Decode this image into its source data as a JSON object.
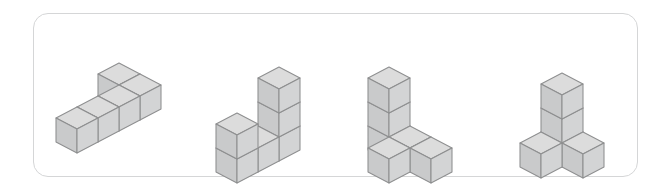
{
  "panel": {
    "name": "cube-figures-panel",
    "border_color": "#d5d6d7",
    "background_color": "#ffffff",
    "corner_radius_px": 15,
    "x": 33,
    "y": 13,
    "width": 605,
    "height": 164
  },
  "render": {
    "image_width": 671,
    "image_height": 191,
    "projection": "isometric",
    "cube_half_width_px": 21,
    "cube_height_px": 24,
    "cube_depth_rise_px": 11,
    "face_colors": {
      "top": "#dcdcdc",
      "left": "#c9cacb",
      "right": "#d3d4d5"
    },
    "outline_color": "#8e8f90",
    "outline_width_px": 1.05
  },
  "figures": [
    {
      "name": "figure-1-l-shape",
      "label": "",
      "cube_count": 5,
      "origin_x": 108,
      "origin_y": 108,
      "description": "flat L-shaped arrangement of five cubes lying on one layer",
      "cubes": [
        {
          "x": 0,
          "y": 0,
          "z": 0
        },
        {
          "x": 1,
          "y": 0,
          "z": 0
        },
        {
          "x": 1,
          "y": 1,
          "z": 0
        },
        {
          "x": 1,
          "y": 2,
          "z": 0
        },
        {
          "x": 1,
          "y": 3,
          "z": 0
        }
      ]
    },
    {
      "name": "figure-2-u-shape",
      "label": "",
      "cube_count": 6,
      "origin_x": 258,
      "origin_y": 125,
      "description": "U-shaped arrangement: row of three cubes with a two-high column on the left end and a one-high column on the right end",
      "cubes": [
        {
          "x": 0,
          "y": 0,
          "z": 0
        },
        {
          "x": 0,
          "y": 1,
          "z": 0
        },
        {
          "x": 0,
          "y": 2,
          "z": 0
        },
        {
          "x": 0,
          "y": 0,
          "z": 1
        },
        {
          "x": 0,
          "y": 0,
          "z": 2
        },
        {
          "x": 0,
          "y": 2,
          "z": 1
        }
      ]
    },
    {
      "name": "figure-3-corner-stack",
      "label": "",
      "cube_count": 6,
      "origin_x": 410,
      "origin_y": 125,
      "description": "three-high column on the right with an arm of cubes extending to the left and one cube in front",
      "cubes": [
        {
          "x": 0,
          "y": 0,
          "z": 0
        },
        {
          "x": 0,
          "y": 0,
          "z": 1
        },
        {
          "x": 0,
          "y": 0,
          "z": 2
        },
        {
          "x": 1,
          "y": 0,
          "z": 0
        },
        {
          "x": 2,
          "y": 0,
          "z": 0
        },
        {
          "x": 1,
          "y": 1,
          "z": 0
        }
      ]
    },
    {
      "name": "figure-4-t-shape",
      "label": "",
      "cube_count": 5,
      "origin_x": 562,
      "origin_y": 125,
      "description": "three-high vertical column with one cube projecting front-left and one cube projecting front-right at the base",
      "cubes": [
        {
          "x": 0,
          "y": 0,
          "z": 0
        },
        {
          "x": 0,
          "y": 0,
          "z": 1
        },
        {
          "x": 0,
          "y": 0,
          "z": 2
        },
        {
          "x": 1,
          "y": 0,
          "z": 0
        },
        {
          "x": 0,
          "y": 1,
          "z": 0
        }
      ]
    }
  ]
}
